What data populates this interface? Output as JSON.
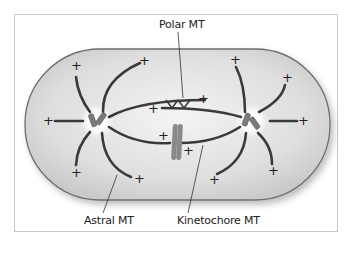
{
  "diagram": {
    "type": "mitotic-spindle",
    "labels": {
      "polar": "Polar MT",
      "astral": "Astral MT",
      "kinetochore": "Kinetochore MT"
    },
    "plus_sign": "+",
    "colors": {
      "cell_fill": "#dcdcdc",
      "cell_stroke": "#6e6e6e",
      "microtubule": "#3a3a3a",
      "centrosome": "#7a7a7a",
      "chromosome": "#8a8a8a",
      "frame": "#c8c8c8"
    }
  }
}
